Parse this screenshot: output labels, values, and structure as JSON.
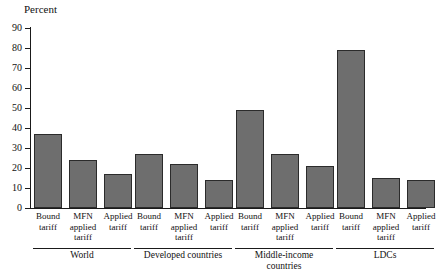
{
  "chart_data": {
    "type": "bar",
    "title": "",
    "ylabel": "Percent",
    "xlabel": "",
    "ylim": [
      0,
      90
    ],
    "ytick_step": 10,
    "yticks": [
      90,
      80,
      70,
      60,
      50,
      40,
      30,
      20,
      10,
      0
    ],
    "grid": false,
    "legend": "none",
    "bar_color": "#6e6e6e",
    "bar_border_color": "#2b2b2b",
    "axis_color": "#1a1a1a",
    "categories": [
      "Bound\ntariff",
      "MFN\napplied\ntariff",
      "Applied\ntariff",
      "Bound\ntariff",
      "MFN\napplied\ntariff",
      "Applied\ntariff",
      "Bound\ntariff",
      "MFN\napplied\ntariff",
      "Applied\ntariff",
      "Bound\ntariff",
      "MFN\napplied\ntariff",
      "Applied\ntariff"
    ],
    "values": [
      37,
      24,
      17,
      27,
      22,
      14,
      49,
      27,
      21,
      79,
      15,
      14
    ],
    "groups": [
      {
        "label": "World",
        "members": [
          "Bound tariff",
          "MFN applied tariff",
          "Applied tariff"
        ],
        "values": [
          37,
          24,
          17
        ]
      },
      {
        "label": "Developed countries",
        "members": [
          "Bound tariff",
          "MFN applied tariff",
          "Applied tariff"
        ],
        "values": [
          27,
          22,
          14
        ]
      },
      {
        "label": "Middle-income\ncountries",
        "members": [
          "Bound tariff",
          "MFN applied tariff",
          "Applied tariff"
        ],
        "values": [
          49,
          27,
          21
        ]
      },
      {
        "label": "LDCs",
        "members": [
          "Bound tariff",
          "MFN applied tariff",
          "Applied tariff"
        ],
        "values": [
          79,
          15,
          14
        ]
      }
    ]
  },
  "ticks": {
    "t0": "90",
    "t1": "80",
    "t2": "70",
    "t3": "60",
    "t4": "50",
    "t5": "40",
    "t6": "30",
    "t7": "20",
    "t8": "10",
    "t9": "0"
  },
  "bar_labels": {
    "b0": "Bound\ntariff",
    "b1": "MFN\napplied\ntariff",
    "b2": "Applied\ntariff",
    "b3": "Bound\ntariff",
    "b4": "MFN\napplied\ntariff",
    "b5": "Applied\ntariff",
    "b6": "Bound\ntariff",
    "b7": "MFN\napplied\ntariff",
    "b8": "Applied\ntariff",
    "b9": "Bound\ntariff",
    "b10": "MFN\napplied\ntariff",
    "b11": "Applied\ntariff"
  },
  "group_labels": {
    "g0": "World",
    "g1": "Developed countries",
    "g2": "Middle-income\ncountries",
    "g3": "LDCs"
  }
}
